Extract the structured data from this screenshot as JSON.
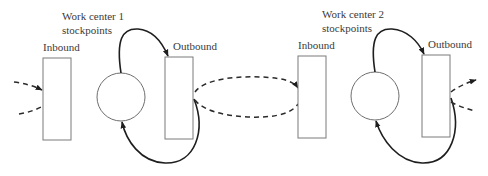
{
  "diagram": {
    "work_centers": [
      {
        "title_line1": "Work center 1",
        "title_line2": "stockpoints",
        "inbound_label": "Inbound",
        "outbound_label": "Outbound"
      },
      {
        "title_line1": "Work center 2",
        "title_line2": "stockpoints",
        "inbound_label": "Inbound",
        "outbound_label": "Outbound"
      }
    ],
    "colors": {
      "stroke": "#1e1e1e",
      "box_stroke": "#7a7a7a",
      "text": "#3a3a3a",
      "background": "#ffffff"
    }
  }
}
